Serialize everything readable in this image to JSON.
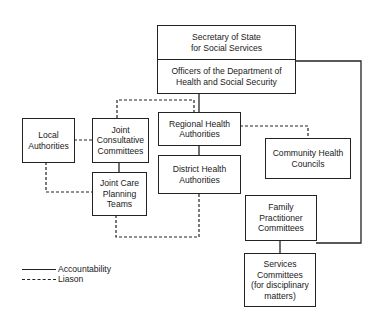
{
  "diagram": {
    "nodes": {
      "secretary": "Secretary of State\nfor Social Services",
      "officers": "Officers of the Department of\nHealth and Social Security",
      "local_authorities": "Local\nAuthorities",
      "joint_consultative": "Joint\nConsultative\nCommittees",
      "regional_health": "Regional Health\nAuthorities",
      "district_health": "District Health\nAuthorities",
      "community_health": "Community Health\nCouncils",
      "joint_care_planning": "Joint Care\nPlanning\nTeams",
      "family_practitioner": "Family\nPractitioner\nCommittees",
      "services_committees": "Services\nCommittees\n(for disciplinary\nmatters)"
    },
    "edges": [
      {
        "from": "officers",
        "to": "regional_health",
        "type": "accountability"
      },
      {
        "from": "regional_health",
        "to": "district_health",
        "type": "accountability"
      },
      {
        "from": "officers",
        "to": "family_practitioner",
        "type": "accountability"
      },
      {
        "from": "family_practitioner",
        "to": "services_committees",
        "type": "accountability"
      },
      {
        "from": "joint_consultative",
        "to": "joint_care_planning",
        "type": "accountability"
      },
      {
        "from": "local_authorities",
        "to": "joint_consultative",
        "type": "liaison"
      },
      {
        "from": "local_authorities",
        "to": "joint_care_planning",
        "type": "liaison"
      },
      {
        "from": "joint_consultative",
        "to": "regional_health",
        "type": "liaison"
      },
      {
        "from": "regional_health",
        "to": "community_health",
        "type": "liaison"
      },
      {
        "from": "joint_care_planning",
        "to": "district_health",
        "type": "liaison"
      }
    ],
    "legend": {
      "accountability": "Accountability",
      "liaison": "Liason"
    },
    "colors": {
      "line": "#222222",
      "background": "#ffffff"
    }
  }
}
